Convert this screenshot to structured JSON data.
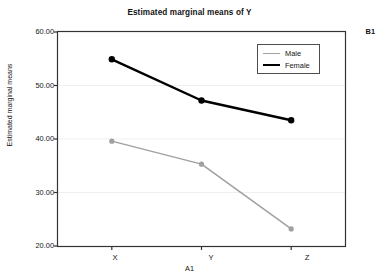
{
  "chart_data": {
    "type": "line",
    "title": "Estimated marginal means of Y",
    "xlabel": "A1",
    "ylabel": "Estimated marginal means",
    "categories": [
      "X",
      "Y",
      "Z"
    ],
    "series": [
      {
        "name": "Male",
        "values": [
          39.6,
          35.3,
          23.2
        ],
        "color": "#a0a0a0"
      },
      {
        "name": "Female",
        "values": [
          54.9,
          47.2,
          43.5
        ],
        "color": "#000000"
      }
    ],
    "ylim": [
      20.0,
      60.0
    ],
    "yticks": [
      "20.00",
      "30.00",
      "40.00",
      "50.00",
      "60.00"
    ],
    "ytick_values": [
      20,
      30,
      40,
      50,
      60
    ],
    "grid": true,
    "legend_position": "top-right",
    "panel_label": "B1",
    "legend": [
      "Male",
      "Female"
    ]
  },
  "axes": {
    "y_title": "Estimated marginal means",
    "x_title": "A1"
  }
}
